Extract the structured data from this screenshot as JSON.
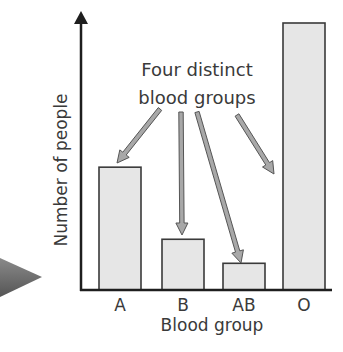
{
  "chart_data": {
    "type": "bar",
    "title": "",
    "xlabel": "Blood group",
    "ylabel": "Number of people",
    "categories": [
      "A",
      "B",
      "AB",
      "O"
    ],
    "values": [
      46,
      19,
      10,
      100
    ],
    "value_units": "relative (no numeric axis shown; O = 100)",
    "ylim": [
      0,
      100
    ],
    "grid": false,
    "legend": null,
    "annotations": [
      {
        "text": "Four distinct blood groups",
        "lines": [
          "Four distinct",
          "blood groups"
        ],
        "arrows_to": [
          "A",
          "B",
          "AB",
          "O"
        ]
      }
    ]
  },
  "colors": {
    "bar_fill": "#e6e6e6",
    "bar_stroke": "#3a3a3a",
    "axis": "#1e1e1e",
    "arrow_fill": "#a8a8a8",
    "arrow_stroke": "#555555",
    "side_pointer": "#6e6e6e"
  }
}
